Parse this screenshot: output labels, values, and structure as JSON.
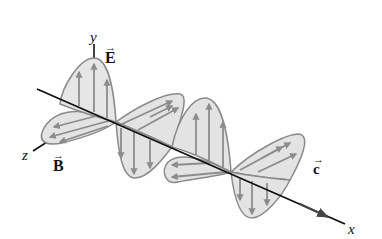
{
  "diagram": {
    "labels": {
      "y_axis": "y",
      "x_axis": "x",
      "z_axis": "z",
      "electric_field": "E",
      "magnetic_field": "B",
      "velocity": "c",
      "vector_arrow": "→"
    },
    "colors": {
      "lobe_fill": "#e3e3e3",
      "lobe_stroke": "#8a8a8a",
      "arrow": "#8c8c8c",
      "axis": "#111111"
    }
  }
}
